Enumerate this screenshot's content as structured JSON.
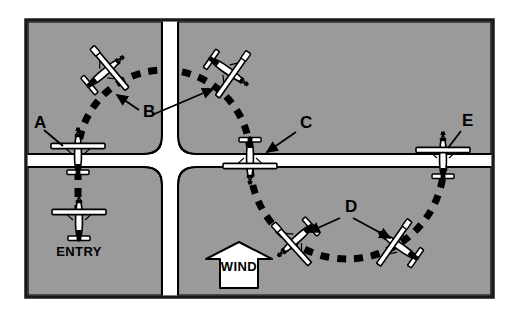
{
  "figure": {
    "background_color": "#ffffff",
    "field_color": "#9a9a9a",
    "road_color": "#ffffff",
    "ink_color": "#000000",
    "border": {
      "color": "#1a1a1a",
      "x": 26,
      "y": 20,
      "width": 467,
      "height": 277
    }
  },
  "roads": {
    "vertical": {
      "label": "vertical-road",
      "x": 162,
      "width": 16
    },
    "horizontal": {
      "label": "horizontal-road",
      "y": 154,
      "height": 13
    }
  },
  "ground_track": {
    "style": "dashed",
    "dash_color": "#000000",
    "upper_arc": {
      "center_x": 164,
      "center_y": 156,
      "radius": 86,
      "from_deg": 180,
      "to_deg": 360
    },
    "lower_arc": {
      "center_x": 347,
      "center_y": 162,
      "radius": 97,
      "from_deg": 0,
      "to_deg": 180
    },
    "entry_leg": {
      "x": 78,
      "from_y": 166,
      "to_y": 214
    }
  },
  "labels": [
    {
      "id": "A",
      "text": "A",
      "x": 34,
      "y": 128,
      "kind": "callout-letter"
    },
    {
      "id": "B",
      "text": "B",
      "x": 143,
      "y": 117,
      "kind": "callout-letter"
    },
    {
      "id": "C",
      "text": "C",
      "x": 300,
      "y": 128,
      "kind": "callout-letter"
    },
    {
      "id": "D",
      "text": "D",
      "x": 345,
      "y": 212,
      "kind": "callout-letter"
    },
    {
      "id": "E",
      "text": "E",
      "x": 462,
      "y": 126,
      "kind": "callout-letter"
    },
    {
      "id": "ENTRY",
      "text": "ENTRY",
      "x": 79,
      "y": 256,
      "kind": "position-label"
    },
    {
      "id": "WIND",
      "text": "WIND",
      "x": 239,
      "y": 271,
      "kind": "wind-arrow-label"
    }
  ],
  "wind": {
    "label": "WIND",
    "direction": "north",
    "arrow_center_x": 239,
    "arrow_top_y": 242,
    "arrow_bottom_y": 288
  },
  "aircraft": [
    {
      "id": "entry",
      "label": "ENTRY",
      "x": 79,
      "y": 218,
      "rotation": 0,
      "bank": "level",
      "heading": "north"
    },
    {
      "id": "A",
      "label": "A",
      "x": 78,
      "y": 152,
      "rotation": 0,
      "bank": "level",
      "heading": "north"
    },
    {
      "id": "B1",
      "label": "B",
      "x": 105,
      "y": 72,
      "rotation": 50,
      "bank": "right",
      "heading": "northeast"
    },
    {
      "id": "B2",
      "label": "B",
      "x": 228,
      "y": 71,
      "rotation": 125,
      "bank": "right",
      "heading": "southeast"
    },
    {
      "id": "C",
      "label": "C",
      "x": 250,
      "y": 160,
      "rotation": 180,
      "bank": "level",
      "heading": "south"
    },
    {
      "id": "D1",
      "label": "D",
      "x": 296,
      "y": 240,
      "rotation": 228,
      "bank": "left",
      "heading": "southwest"
    },
    {
      "id": "D2",
      "label": "D",
      "x": 399,
      "y": 246,
      "rotation": 305,
      "bank": "left",
      "heading": "northwest"
    },
    {
      "id": "E",
      "label": "E",
      "x": 443,
      "y": 156,
      "rotation": 0,
      "bank": "level",
      "heading": "north"
    }
  ],
  "callout_lines": [
    {
      "from": "A",
      "x1": 44,
      "y1": 130,
      "x2": 63,
      "y2": 146,
      "arrow": false
    },
    {
      "from": "B",
      "x1": 139,
      "y1": 110,
      "x2": 117,
      "y2": 95,
      "arrow": true
    },
    {
      "from": "B",
      "x1": 152,
      "y1": 115,
      "x2": 213,
      "y2": 89,
      "arrow": true
    },
    {
      "from": "C",
      "x1": 296,
      "y1": 132,
      "x2": 267,
      "y2": 152,
      "arrow": true
    },
    {
      "from": "D",
      "x1": 340,
      "y1": 218,
      "x2": 309,
      "y2": 232,
      "arrow": true
    },
    {
      "from": "D",
      "x1": 353,
      "y1": 218,
      "x2": 390,
      "y2": 238,
      "arrow": true
    },
    {
      "from": "E",
      "x1": 461,
      "y1": 131,
      "x2": 448,
      "y2": 148,
      "arrow": false
    }
  ]
}
